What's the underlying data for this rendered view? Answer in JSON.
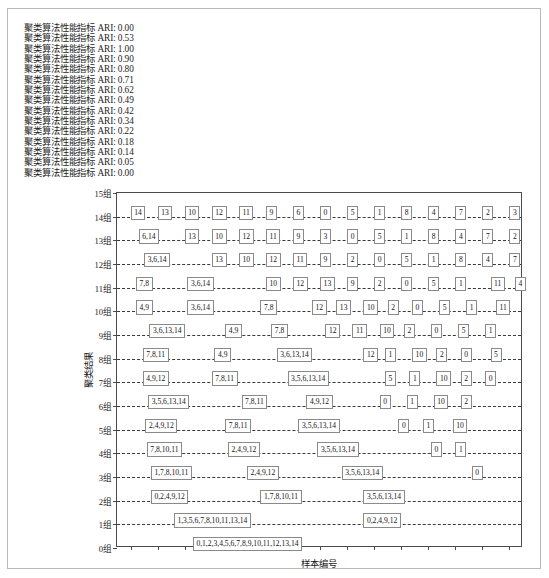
{
  "log": {
    "lines": [
      "聚类算法性能指标 ARI: 0.00",
      "聚类算法性能指标 ARI: 0.53",
      "聚类算法性能指标 ARI: 1.00",
      "聚类算法性能指标 ARI: 0.90",
      "聚类算法性能指标 ARI: 0.80",
      "聚类算法性能指标 ARI: 0.71",
      "聚类算法性能指标 ARI: 0.62",
      "聚类算法性能指标 ARI: 0.49",
      "聚类算法性能指标 ARI: 0.42",
      "聚类算法性能指标 ARI: 0.34",
      "聚类算法性能指标 ARI: 0.22",
      "聚类算法性能指标 ARI: 0.18",
      "聚类算法性能指标 ARI: 0.14",
      "聚类算法性能指标 ARI: 0.05",
      "聚类算法性能指标 ARI: 0.00"
    ]
  },
  "chart_data": {
    "type": "table",
    "title": "",
    "xlabel": "样本编号",
    "ylabel": "聚类结果",
    "grid": true,
    "legend": null,
    "ylim": [
      0,
      15
    ],
    "xlim": [
      -0.5,
      14.5
    ],
    "ytick_labels": [
      "0组",
      "1组",
      "2组",
      "3组",
      "4组",
      "5组",
      "6组",
      "7组",
      "8组",
      "9组",
      "10组",
      "11组",
      "12组",
      "13组",
      "14组",
      "15组"
    ],
    "ytick_values": [
      0,
      1,
      2,
      3,
      4,
      5,
      6,
      7,
      8,
      9,
      10,
      11,
      12,
      13,
      14,
      15
    ],
    "xtick_values": [
      0,
      1,
      2,
      3,
      4,
      5,
      6,
      7,
      8,
      9,
      10,
      11,
      12,
      13,
      14
    ],
    "xtick_labels": [
      "",
      "",
      "",
      "",
      "",
      "",
      "",
      "",
      "",
      "",
      "",
      "",
      "",
      "",
      ""
    ],
    "rows": [
      {
        "level": 14,
        "cells": [
          {
            "label": "14",
            "x": 0
          },
          {
            "label": "13",
            "x": 1
          },
          {
            "label": "10",
            "x": 2
          },
          {
            "label": "12",
            "x": 3
          },
          {
            "label": "11",
            "x": 4
          },
          {
            "label": "9",
            "x": 5
          },
          {
            "label": "6",
            "x": 6
          },
          {
            "label": "0",
            "x": 7
          },
          {
            "label": "5",
            "x": 8
          },
          {
            "label": "1",
            "x": 9
          },
          {
            "label": "8",
            "x": 10
          },
          {
            "label": "4",
            "x": 11
          },
          {
            "label": "7",
            "x": 12
          },
          {
            "label": "2",
            "x": 13
          },
          {
            "label": "3",
            "x": 14
          }
        ]
      },
      {
        "level": 13,
        "cells": [
          {
            "label": "6,14",
            "x": 0.3
          },
          {
            "label": "13",
            "x": 2
          },
          {
            "label": "10",
            "x": 3
          },
          {
            "label": "12",
            "x": 4
          },
          {
            "label": "11",
            "x": 5
          },
          {
            "label": "9",
            "x": 6
          },
          {
            "label": "3",
            "x": 7
          },
          {
            "label": "0",
            "x": 8
          },
          {
            "label": "5",
            "x": 9
          },
          {
            "label": "1",
            "x": 10
          },
          {
            "label": "8",
            "x": 11
          },
          {
            "label": "4",
            "x": 12
          },
          {
            "label": "7",
            "x": 13
          },
          {
            "label": "2",
            "x": 14
          }
        ]
      },
      {
        "level": 12,
        "cells": [
          {
            "label": "3,6,14",
            "x": 0.5
          },
          {
            "label": "13",
            "x": 3
          },
          {
            "label": "10",
            "x": 4
          },
          {
            "label": "12",
            "x": 5
          },
          {
            "label": "11",
            "x": 6
          },
          {
            "label": "9",
            "x": 7
          },
          {
            "label": "2",
            "x": 8
          },
          {
            "label": "0",
            "x": 9
          },
          {
            "label": "5",
            "x": 10
          },
          {
            "label": "1",
            "x": 11
          },
          {
            "label": "8",
            "x": 12
          },
          {
            "label": "4",
            "x": 13
          },
          {
            "label": "7",
            "x": 14
          }
        ]
      },
      {
        "level": 11,
        "cells": [
          {
            "label": "7,8",
            "x": 0.2
          },
          {
            "label": "3,6,14",
            "x": 2.1
          },
          {
            "label": "10",
            "x": 5
          },
          {
            "label": "12",
            "x": 6
          },
          {
            "label": "13",
            "x": 7
          },
          {
            "label": "9",
            "x": 8
          },
          {
            "label": "2",
            "x": 9
          },
          {
            "label": "0",
            "x": 10
          },
          {
            "label": "5",
            "x": 11
          },
          {
            "label": "1",
            "x": 12
          },
          {
            "label": "11",
            "x": 13.3
          },
          {
            "label": "4",
            "x": 14.2
          }
        ]
      },
      {
        "level": 10,
        "cells": [
          {
            "label": "4,9",
            "x": 0.2
          },
          {
            "label": "3,6,14",
            "x": 2.1
          },
          {
            "label": "7,8",
            "x": 4.8
          },
          {
            "label": "12",
            "x": 6.7
          },
          {
            "label": "13",
            "x": 7.6
          },
          {
            "label": "10",
            "x": 8.6
          },
          {
            "label": "2",
            "x": 9.5
          },
          {
            "label": "0",
            "x": 10.4
          },
          {
            "label": "5",
            "x": 11.4
          },
          {
            "label": "1",
            "x": 12.4
          },
          {
            "label": "11",
            "x": 13.5
          }
        ]
      },
      {
        "level": 9,
        "cells": [
          {
            "label": "3,6,13,14",
            "x": 0.7
          },
          {
            "label": "4,9",
            "x": 3.5
          },
          {
            "label": "7,8",
            "x": 5.2
          },
          {
            "label": "12",
            "x": 7.2
          },
          {
            "label": "11",
            "x": 8.2
          },
          {
            "label": "10",
            "x": 9.2
          },
          {
            "label": "2",
            "x": 10.1
          },
          {
            "label": "0",
            "x": 11.1
          },
          {
            "label": "5",
            "x": 12.1
          },
          {
            "label": "1",
            "x": 13.1
          }
        ]
      },
      {
        "level": 8,
        "cells": [
          {
            "label": "7,8,11",
            "x": 0.45
          },
          {
            "label": "4,9",
            "x": 3.1
          },
          {
            "label": "3,6,13,14",
            "x": 5.4
          },
          {
            "label": "12",
            "x": 8.6
          },
          {
            "label": "1",
            "x": 9.4
          },
          {
            "label": "10",
            "x": 10.4
          },
          {
            "label": "2",
            "x": 11.3
          },
          {
            "label": "0",
            "x": 12.2
          },
          {
            "label": "5",
            "x": 13.3
          }
        ]
      },
      {
        "level": 7,
        "cells": [
          {
            "label": "4,9,12",
            "x": 0.45
          },
          {
            "label": "7,8,11",
            "x": 3.0
          },
          {
            "label": "3,5,6,13,14",
            "x": 5.8
          },
          {
            "label": "5",
            "x": 9.4
          },
          {
            "label": "1",
            "x": 10.3
          },
          {
            "label": "10",
            "x": 11.3
          },
          {
            "label": "2",
            "x": 12.2
          },
          {
            "label": "0",
            "x": 13.1
          }
        ]
      },
      {
        "level": 6,
        "cells": [
          {
            "label": "3,5,6,13,14",
            "x": 0.65
          },
          {
            "label": "7,8,11",
            "x": 4.1
          },
          {
            "label": "4,9,12",
            "x": 6.5
          },
          {
            "label": "0",
            "x": 9.2
          },
          {
            "label": "1",
            "x": 10.2
          },
          {
            "label": "10",
            "x": 11.2
          },
          {
            "label": "2",
            "x": 12.2
          }
        ]
      },
      {
        "level": 5,
        "cells": [
          {
            "label": "2,4,9,12",
            "x": 0.55
          },
          {
            "label": "7,8,11",
            "x": 3.5
          },
          {
            "label": "3,5,6,13,14",
            "x": 6.2
          },
          {
            "label": "0",
            "x": 9.9
          },
          {
            "label": "1",
            "x": 10.8
          },
          {
            "label": "10",
            "x": 11.9
          }
        ]
      },
      {
        "level": 4,
        "cells": [
          {
            "label": "7,8,10,11",
            "x": 0.6
          },
          {
            "label": "2,4,9,12",
            "x": 3.6
          },
          {
            "label": "3,5,6,13,14",
            "x": 6.9
          },
          {
            "label": "0",
            "x": 11.1
          },
          {
            "label": "1",
            "x": 12.0
          }
        ]
      },
      {
        "level": 3,
        "cells": [
          {
            "label": "1,7,8,10,11",
            "x": 0.75
          },
          {
            "label": "2,4,9,12",
            "x": 4.3
          },
          {
            "label": "3,5,6,13,14",
            "x": 7.8
          },
          {
            "label": "0",
            "x": 12.6
          }
        ]
      },
      {
        "level": 2,
        "cells": [
          {
            "label": "0,2,4,9,12",
            "x": 0.75
          },
          {
            "label": "1,7,8,10,11",
            "x": 4.8
          },
          {
            "label": "3,5,6,13,14",
            "x": 8.6
          }
        ]
      },
      {
        "level": 1,
        "cells": [
          {
            "label": "1,3,5,6,7,8,10,11,13,14",
            "x": 1.6
          },
          {
            "label": "0,2,4,9,12",
            "x": 8.6
          }
        ]
      },
      {
        "level": 0,
        "cells": [
          {
            "label": "0,1,2,3,4,5,6,7,8,9,10,11,12,13,14",
            "x": 2.3
          }
        ]
      }
    ]
  }
}
